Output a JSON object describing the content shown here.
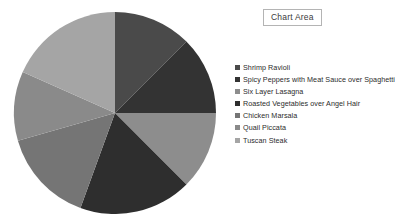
{
  "chart_area": {
    "label": "Chart Area"
  },
  "legend": {
    "position": "right",
    "marker": "square-swatch"
  },
  "chart_data": {
    "type": "pie",
    "title": "",
    "subtitle": "",
    "xlabel": "",
    "ylabel": "",
    "grid": false,
    "legend_position": "right",
    "start_angle_deg": 0,
    "direction": "clockwise",
    "categories": [
      "Shrimp Ravioli",
      "Spicy Peppers with Meat Sauce over Spaghetti",
      "Six Layer Lasagna",
      "Roasted Vegetables over Angel Hair",
      "Chicken Marsala",
      "Quail Piccata",
      "Tuscan Steak"
    ],
    "values": [
      12.5,
      12.5,
      12.5,
      18.0,
      15.0,
      11.0,
      18.5
    ],
    "slice_angles_deg": [
      45,
      45,
      45,
      65,
      54,
      40,
      66
    ],
    "colors": [
      "#4a4a4a",
      "#333333",
      "#8d8d8d",
      "#2e2e2e",
      "#757575",
      "#8a8a8a",
      "#a5a5a5"
    ]
  }
}
